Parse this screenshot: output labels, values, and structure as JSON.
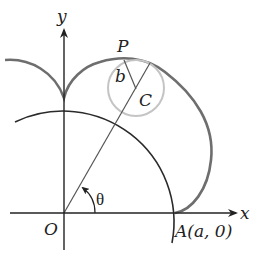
{
  "figure": {
    "type": "epicycloid construction",
    "labels": {
      "y_axis": "y",
      "x_axis": "x",
      "origin": "O",
      "point_p": "P",
      "center_c": "C",
      "radius_b": "b",
      "angle": "θ",
      "point_a": "A(a, 0)"
    },
    "colors": {
      "axis": "#222222",
      "fixed_circle": "#2a2a2a",
      "epicycloid": "#6e6e6e",
      "rolling_circle": "#c4c4c4",
      "ray": "#555555"
    }
  }
}
